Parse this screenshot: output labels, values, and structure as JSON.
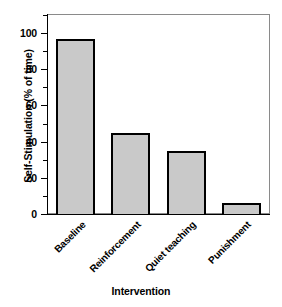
{
  "chart_data": {
    "type": "bar",
    "title": "",
    "xlabel": "Intervention",
    "ylabel": "Self-Stimulation (% of time)",
    "categories": [
      "Baseline",
      "Reinforcement",
      "Quiet teaching",
      "Punishment"
    ],
    "values": [
      97,
      45,
      35,
      6
    ],
    "ylim": [
      0,
      110
    ],
    "yticks": [
      0,
      20,
      40,
      60,
      80,
      100
    ],
    "ytick_labels": [
      "0",
      "20",
      "40",
      "60",
      "80",
      "100"
    ],
    "yminor_ticks": [
      10,
      30,
      50,
      70,
      90,
      110
    ],
    "grid": false,
    "legend": null,
    "bar_fill_color": "#c9c9c9",
    "bar_edge_color": "#000000",
    "frame_color": "#8a8a8a"
  }
}
